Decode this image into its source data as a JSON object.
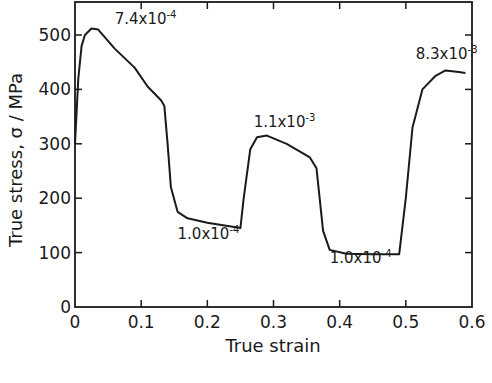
{
  "chart_data": {
    "type": "line",
    "title": "",
    "xlabel": "True strain",
    "ylabel": "True stress, σ / MPa",
    "xlim": [
      0,
      0.6
    ],
    "ylim": [
      0,
      550
    ],
    "x_ticks": [
      0,
      0.1,
      0.2,
      0.3,
      0.4,
      0.5,
      0.6
    ],
    "x_tick_labels": [
      "0",
      "0.1",
      "0.2",
      "0.3",
      "0.4",
      "0.5",
      "0.6"
    ],
    "y_ticks": [
      0,
      100,
      200,
      300,
      400,
      500
    ],
    "y_tick_labels": [
      "0",
      "100",
      "200",
      "300",
      "400",
      "500"
    ],
    "grid": false,
    "legend": null,
    "series": [
      {
        "name": "stress-strain",
        "x": [
          0,
          0.005,
          0.01,
          0.015,
          0.025,
          0.035,
          0.06,
          0.09,
          0.11,
          0.13,
          0.135,
          0.14,
          0.145,
          0.155,
          0.17,
          0.2,
          0.25,
          0.255,
          0.265,
          0.275,
          0.29,
          0.32,
          0.355,
          0.365,
          0.375,
          0.385,
          0.41,
          0.45,
          0.49,
          0.5,
          0.51,
          0.525,
          0.545,
          0.56,
          0.58,
          0.59
        ],
        "y": [
          300,
          420,
          480,
          500,
          512,
          510,
          475,
          440,
          405,
          380,
          370,
          300,
          220,
          175,
          163,
          155,
          145,
          200,
          290,
          312,
          315,
          300,
          275,
          255,
          140,
          105,
          98,
          97,
          97,
          200,
          330,
          400,
          425,
          435,
          432,
          430
        ]
      }
    ],
    "annotations": [
      {
        "text": "7.4x10",
        "exp": "-4",
        "x": 0.06,
        "y": 520
      },
      {
        "text": "1.0x10",
        "exp": "-4",
        "x": 0.155,
        "y": 125
      },
      {
        "text": "1.1x10",
        "exp": "-3",
        "x": 0.27,
        "y": 330
      },
      {
        "text": "1.0x10",
        "exp": "-4",
        "x": 0.385,
        "y": 80
      },
      {
        "text": "8.3x10",
        "exp": "-3",
        "x": 0.515,
        "y": 455
      }
    ]
  }
}
